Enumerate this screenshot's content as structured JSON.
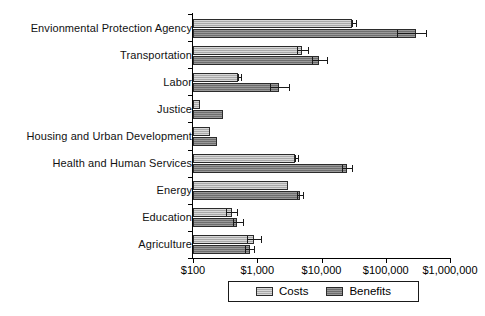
{
  "chart_data": {
    "type": "bar",
    "orientation": "horizontal",
    "title": "",
    "xlabel": "",
    "ylabel": "",
    "xscale": "log",
    "xlim": [
      100,
      1000000
    ],
    "grid": false,
    "legend_position": "bottom",
    "xtick_labels": [
      "$100",
      "$1,000",
      "$10,000",
      "$100,000",
      "$1,000,000"
    ],
    "xtick_values": [
      100,
      1000,
      10000,
      100000,
      1000000
    ],
    "categories": [
      "Envionmental Protection Agency",
      "Transportation",
      "Labor",
      "Justice",
      "Housing and Urban Development",
      "Health and Human Services",
      "Energy",
      "Education",
      "Agriculture"
    ],
    "series": [
      {
        "name": "Costs",
        "color": "#a9a9a9",
        "values": [
          30000,
          5000,
          500,
          130,
          185,
          3800,
          3000,
          400,
          900
        ],
        "err_low": [
          30000,
          4200,
          500,
          130,
          185,
          3800,
          3000,
          330,
          700
        ],
        "err_high": [
          34000,
          6200,
          560,
          130,
          185,
          4300,
          3000,
          480,
          1150
        ]
      },
      {
        "name": "Benefits",
        "color": "#6e6e6e",
        "values": [
          300000,
          9000,
          2200,
          290,
          240,
          25000,
          4600,
          480,
          760
        ],
        "err_low": [
          150000,
          7000,
          1600,
          290,
          240,
          21000,
          4200,
          420,
          640
        ],
        "err_high": [
          420000,
          12000,
          3100,
          290,
          240,
          30000,
          5200,
          600,
          900
        ]
      }
    ]
  },
  "legend": {
    "entries": [
      {
        "label": "Costs",
        "key": "costs"
      },
      {
        "label": "Benefits",
        "key": "benefits"
      }
    ]
  }
}
